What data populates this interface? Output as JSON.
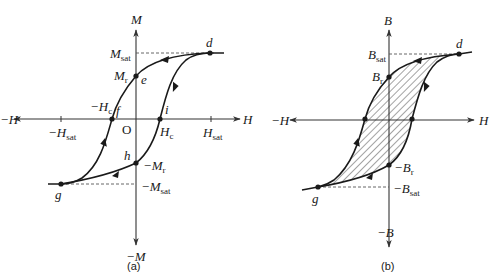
{
  "figure": {
    "panel_a": {
      "caption": "(a)",
      "axes": {
        "y_pos": "M",
        "y_neg": "−M",
        "x_pos": "H",
        "x_neg": "−H",
        "origin": "O"
      },
      "labels": {
        "m_sat": "M",
        "m_sat_sub": "sat",
        "m_r": "M",
        "m_r_sub": "r",
        "neg_m_r": "−M",
        "neg_m_r_sub": "r",
        "neg_m_sat": "−M",
        "neg_m_sat_sub": "sat",
        "neg_h_c": "−H",
        "neg_h_c_sub": "c",
        "h_c": "H",
        "h_c_sub": "c",
        "h_sat": "H",
        "h_sat_sub": "sat",
        "neg_h_sat": "−H",
        "neg_h_sat_sub": "sat"
      },
      "points": {
        "d": "d",
        "e": "e",
        "f": "f",
        "g": "g",
        "h": "h",
        "i": "i"
      }
    },
    "panel_b": {
      "caption": "(b)",
      "axes": {
        "y_pos": "B",
        "y_neg": "−B",
        "x_pos": "H",
        "x_neg": "−H"
      },
      "labels": {
        "b_sat": "B",
        "b_sat_sub": "sat",
        "b_r": "B",
        "b_r_sub": "r",
        "neg_b_r": "−B",
        "neg_b_r_sub": "r",
        "neg_b_sat": "−B",
        "neg_b_sat_sub": "sat"
      },
      "points": {
        "d": "d",
        "g": "g"
      },
      "shaded_area": "hatched hysteresis loop area"
    }
  }
}
